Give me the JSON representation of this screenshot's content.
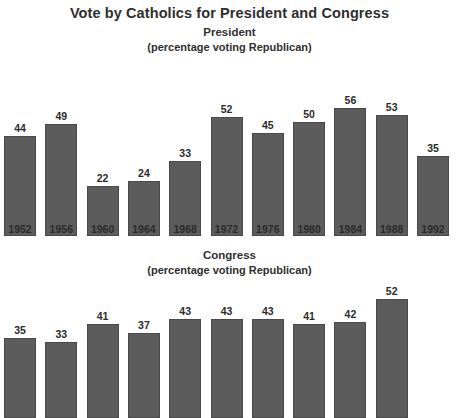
{
  "figure": {
    "main_title": "Vote by Catholics for President and Congress",
    "bar_color": "#5c5c5c",
    "background_color": "#ffffff",
    "text_color": "#2b2b2b"
  },
  "chart_data": [
    {
      "type": "bar",
      "title": "President",
      "subtitle": "(percentage voting Republican)",
      "xlabel": "",
      "ylabel": "",
      "ylim": [
        0,
        60
      ],
      "grid": false,
      "legend": null,
      "categories": [
        "1952",
        "1956",
        "1960",
        "1964",
        "1968",
        "1972",
        "1976",
        "1980",
        "1984",
        "1988",
        "1992"
      ],
      "values": [
        44,
        49,
        22,
        24,
        33,
        52,
        45,
        50,
        56,
        53,
        35
      ],
      "tick_labels": [
        "1952",
        "1956",
        "1960",
        "1964",
        "1968",
        "1972",
        "1976",
        "1980",
        "1984",
        "1988",
        "1992"
      ],
      "data_labels": [
        "44",
        "49",
        "22",
        "24",
        "33",
        "52",
        "45",
        "50",
        "56",
        "53",
        "35"
      ]
    },
    {
      "type": "bar",
      "title": "Congress",
      "subtitle": "(percentage voting Republican)",
      "xlabel": "",
      "ylabel": "",
      "ylim": [
        0,
        60
      ],
      "grid": false,
      "legend": null,
      "categories": [
        "1952",
        "1956",
        "1960",
        "1964",
        "1968",
        "1972",
        "1976",
        "1980",
        "1984",
        "1988"
      ],
      "values": [
        35,
        33,
        41,
        37,
        43,
        43,
        43,
        41,
        42,
        52
      ],
      "tick_labels": [],
      "data_labels": [
        "35",
        "33",
        "41",
        "37",
        "43",
        "43",
        "43",
        "41",
        "42",
        "52"
      ]
    }
  ]
}
